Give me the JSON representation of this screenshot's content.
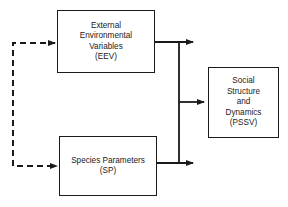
{
  "diagram": {
    "nodes": [
      {
        "id": "eev",
        "lines": [
          "External",
          "Environmental",
          "Variables",
          "(EEV)"
        ]
      },
      {
        "id": "sp",
        "lines": [
          "Species Parameters",
          "(SP)"
        ]
      },
      {
        "id": "pssv",
        "lines": [
          "Social",
          "Structure",
          "and",
          "Dynamics",
          "(PSSV)"
        ]
      }
    ],
    "edges": [
      {
        "from": "feedback",
        "to": "eev",
        "style": "dashed"
      },
      {
        "from": "feedback",
        "to": "sp",
        "style": "dashed"
      },
      {
        "from": "eev",
        "to": "bus",
        "style": "solid"
      },
      {
        "from": "sp",
        "to": "bus",
        "style": "solid"
      },
      {
        "from": "bus",
        "to": "pssv",
        "style": "solid"
      }
    ],
    "colors": {
      "stroke": "#1a1a1a",
      "background": "#ffffff"
    }
  }
}
